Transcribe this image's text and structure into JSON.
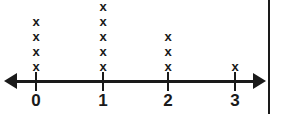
{
  "figure": {
    "name": "line-plot",
    "background_color": "#ffffff",
    "ink_color": "#1a1a1a"
  },
  "axis": {
    "left_arrow": true,
    "right_arrow": true,
    "tick_labels": [
      "0",
      "1",
      "2",
      "3"
    ],
    "tick_x_positions": [
      36,
      103,
      168,
      235
    ]
  },
  "marks": {
    "glyph": "x",
    "counts": [
      4,
      5,
      3,
      1
    ]
  },
  "edge_rule": {
    "visible": true
  },
  "chart_data": {
    "type": "scatter",
    "plot_style": "dot-plot",
    "title": "",
    "subtitle": "",
    "xlabel": "",
    "ylabel": "",
    "categories": [
      "0",
      "1",
      "2",
      "3"
    ],
    "x": [
      0,
      1,
      2,
      3
    ],
    "values": [
      4,
      5,
      3,
      1
    ],
    "marker": "x",
    "xlim": [
      0,
      3
    ],
    "ylim": [
      0,
      5
    ],
    "grid": false,
    "legend": null,
    "annotations": [],
    "total_count": 13,
    "tick_labels": [
      "0",
      "1",
      "2",
      "3"
    ]
  }
}
